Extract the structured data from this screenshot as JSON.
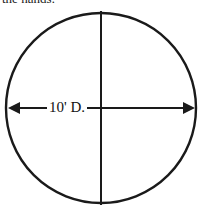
{
  "caption": "the hands:",
  "diagram": {
    "shape": "circle",
    "dimension_label": "10' D.",
    "stroke_color": "#1a1a1a",
    "background": "#ffffff"
  }
}
